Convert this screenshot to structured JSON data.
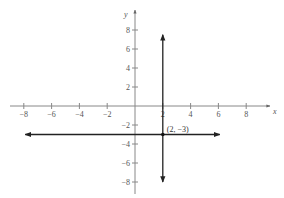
{
  "chart_data": {
    "type": "line",
    "title": "",
    "xlabel": "x",
    "ylabel": "y",
    "xlim": [
      -9,
      9
    ],
    "ylim": [
      -9,
      9
    ],
    "grid": false,
    "x_ticks": [
      -8,
      -6,
      -4,
      -2,
      2,
      4,
      6,
      8
    ],
    "y_ticks": [
      8,
      6,
      4,
      2,
      -2,
      -4,
      -6,
      -8
    ],
    "x_tick_labels": [
      "−8",
      "−6",
      "−4",
      "−2",
      "2",
      "4",
      "6",
      "8"
    ],
    "y_tick_labels": [
      "8",
      "6",
      "4",
      "2",
      "−2",
      "−4",
      "−6",
      "−8"
    ],
    "series": [
      {
        "name": "horizontal line y = -3",
        "equation": "y = -3",
        "x": [
          -7.9,
          6.1
        ],
        "y": [
          -3,
          -3
        ],
        "arrows": "both"
      },
      {
        "name": "vertical line x = 2",
        "equation": "x = 2",
        "x": [
          2,
          2
        ],
        "y": [
          7.5,
          -8
        ],
        "arrows": "both"
      }
    ],
    "points": [
      {
        "x": 2,
        "y": -3,
        "label": "(2, −3)"
      }
    ],
    "annotations": [
      "(2, −3)"
    ]
  }
}
